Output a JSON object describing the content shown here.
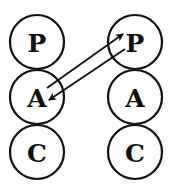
{
  "diagram": {
    "type": "transactional-analysis-pac",
    "colors": {
      "stroke": "#111111",
      "background": "#ffffff"
    },
    "left_person": {
      "states": [
        {
          "label": "P",
          "name": "Parent"
        },
        {
          "label": "A",
          "name": "Adult"
        },
        {
          "label": "C",
          "name": "Child"
        }
      ]
    },
    "right_person": {
      "states": [
        {
          "label": "P",
          "name": "Parent"
        },
        {
          "label": "A",
          "name": "Adult"
        },
        {
          "label": "C",
          "name": "Child"
        }
      ]
    },
    "transactions": [
      {
        "from": "left.A",
        "to": "right.P",
        "direction": "stimulus"
      },
      {
        "from": "right.P",
        "to": "left.A",
        "direction": "response"
      }
    ]
  }
}
